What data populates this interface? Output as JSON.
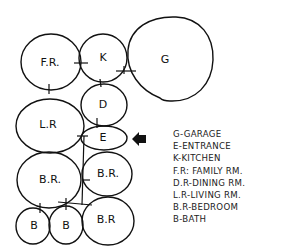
{
  "diagram": {
    "type": "bubble-adjacency-diagram",
    "rooms": [
      {
        "id": "FR",
        "label": "F.R.",
        "cx": 51,
        "cy": 62,
        "rx": 30,
        "ry": 28
      },
      {
        "id": "K",
        "label": "K",
        "cx": 103,
        "cy": 58,
        "rx": 24,
        "ry": 24
      },
      {
        "id": "G",
        "label": "G",
        "cx": 170,
        "cy": 58,
        "rx": 44,
        "ry": 42
      },
      {
        "id": "D",
        "label": "D",
        "cx": 104,
        "cy": 105,
        "rx": 23,
        "ry": 21
      },
      {
        "id": "LR",
        "label": "L.R",
        "cx": 50,
        "cy": 126,
        "rx": 34,
        "ry": 27
      },
      {
        "id": "E",
        "label": "E",
        "cx": 104,
        "cy": 138,
        "rx": 23,
        "ry": 12
      },
      {
        "id": "BR1",
        "label": "B.R.",
        "cx": 49,
        "cy": 180,
        "rx": 32,
        "ry": 28
      },
      {
        "id": "BR2",
        "label": "B.R.",
        "cx": 107,
        "cy": 174,
        "rx": 25,
        "ry": 22
      },
      {
        "id": "B1",
        "label": "B",
        "cx": 33,
        "cy": 226,
        "rx": 17,
        "ry": 18
      },
      {
        "id": "B2",
        "label": "B",
        "cx": 66,
        "cy": 225,
        "rx": 17,
        "ry": 19
      },
      {
        "id": "BR3",
        "label": "B.R",
        "cx": 108,
        "cy": 221,
        "rx": 26,
        "ry": 24
      }
    ],
    "entry_arrow": {
      "direction": "left",
      "target": "E"
    },
    "legend": [
      "G-GARAGE",
      "E-ENTRANCE",
      "K-KITCHEN",
      "F.R: FAMILY RM.",
      "D.R-DINING RM.",
      "L.R-LIVING RM.",
      "B.R-BEDROOM",
      "B-BATH"
    ]
  }
}
